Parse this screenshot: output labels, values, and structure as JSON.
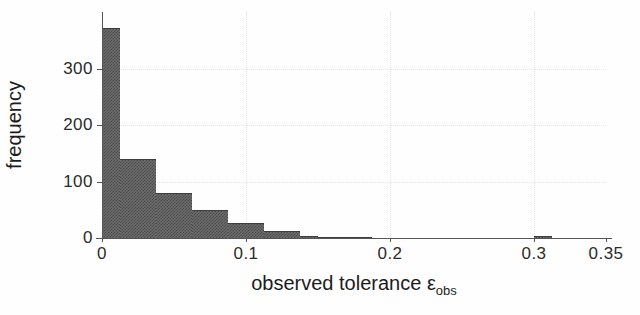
{
  "chart_data": {
    "type": "bar",
    "title": "",
    "subtitle": "",
    "xlabel": "observed tolerance εobs",
    "xlabel_base": "observed tolerance ε",
    "xlabel_subscript": "obs",
    "ylabel": "frequency",
    "xlim": [
      0,
      0.35
    ],
    "ylim": [
      0,
      400
    ],
    "grid": true,
    "legend": null,
    "bin_width": 0.0125,
    "xticks": [
      0,
      0.1,
      0.2,
      0.3,
      0.35
    ],
    "xticklabels": [
      "0",
      "0.1",
      "0.2",
      "0.3",
      "0.35"
    ],
    "yticks": [
      0,
      100,
      200,
      300
    ],
    "yticklabels": [
      "0",
      "100",
      "200",
      "300"
    ],
    "bar_color": "#5a5a5a",
    "bin_edges": [
      0.0,
      0.0125,
      0.025,
      0.0375,
      0.05,
      0.0625,
      0.075,
      0.0875,
      0.1,
      0.1125,
      0.125,
      0.1375,
      0.15,
      0.1625,
      0.175,
      0.1875,
      0.2,
      0.2125,
      0.225,
      0.2375,
      0.25,
      0.2625,
      0.275,
      0.2875,
      0.3,
      0.3125,
      0.325,
      0.3375,
      0.35
    ],
    "values": [
      372,
      140,
      140,
      80,
      80,
      50,
      50,
      26,
      26,
      13,
      13,
      4,
      2,
      1,
      1,
      0,
      0,
      0,
      0,
      0,
      0,
      0,
      0,
      0,
      3,
      0,
      0,
      0
    ],
    "bars": [
      {
        "x0": 0.0,
        "x1": 0.0125,
        "value": 372
      },
      {
        "x0": 0.0125,
        "x1": 0.025,
        "value": 140
      },
      {
        "x0": 0.025,
        "x1": 0.0375,
        "value": 140
      },
      {
        "x0": 0.0375,
        "x1": 0.05,
        "value": 80
      },
      {
        "x0": 0.05,
        "x1": 0.0625,
        "value": 80
      },
      {
        "x0": 0.0625,
        "x1": 0.075,
        "value": 50
      },
      {
        "x0": 0.075,
        "x1": 0.0875,
        "value": 50
      },
      {
        "x0": 0.0875,
        "x1": 0.1,
        "value": 26
      },
      {
        "x0": 0.1,
        "x1": 0.1125,
        "value": 26
      },
      {
        "x0": 0.1125,
        "x1": 0.125,
        "value": 13
      },
      {
        "x0": 0.125,
        "x1": 0.1375,
        "value": 13
      },
      {
        "x0": 0.1375,
        "x1": 0.15,
        "value": 4
      },
      {
        "x0": 0.15,
        "x1": 0.1625,
        "value": 2
      },
      {
        "x0": 0.1625,
        "x1": 0.175,
        "value": 1
      },
      {
        "x0": 0.175,
        "x1": 0.1875,
        "value": 1
      },
      {
        "x0": 0.3,
        "x1": 0.3125,
        "value": 3
      }
    ],
    "gridlines_v": [
      0.1,
      0.2,
      0.3
    ],
    "gridlines_h": [
      100,
      200,
      300
    ]
  }
}
